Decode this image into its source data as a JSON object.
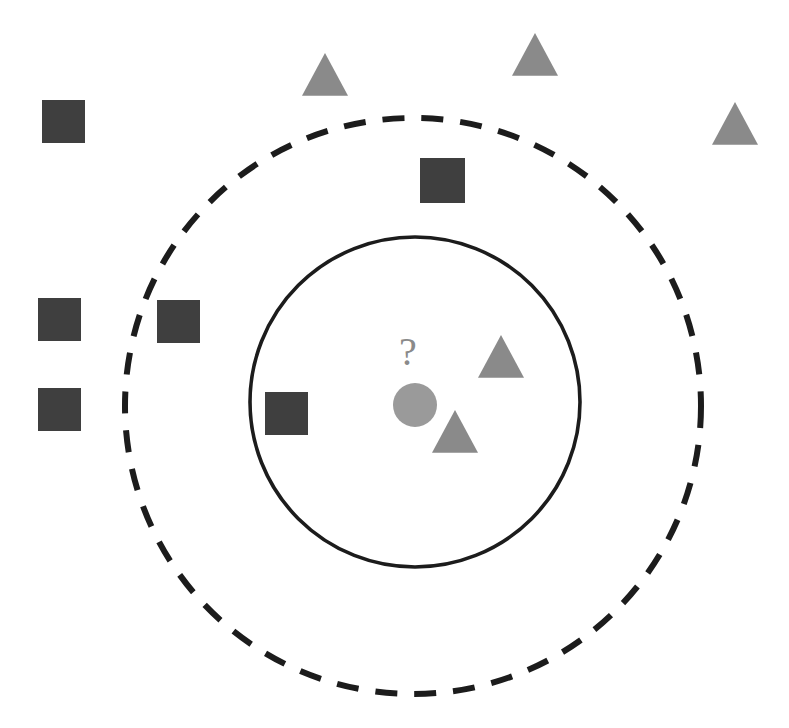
{
  "figure": {
    "title": "",
    "background_color": "#ffffff",
    "width": 789,
    "height": 728,
    "query_symbol": "?"
  },
  "palette": {
    "class_a_color": "#3f3f3f",
    "class_b_color": "#8a8a8a",
    "query_color": "#9a9a9a",
    "boundary_color": "#1c1c1c"
  },
  "boundaries": [
    {
      "name": "outer-boundary",
      "style": "dashed",
      "cx": 413,
      "cy": 406,
      "r": 288,
      "stroke": "#1c1c1c",
      "stroke_width": 6,
      "dasharray": "22 17"
    },
    {
      "name": "inner-boundary",
      "style": "solid",
      "cx": 415,
      "cy": 402,
      "r": 165,
      "stroke": "#1c1c1c",
      "stroke_width": 3.6,
      "dasharray": ""
    }
  ],
  "query_point": {
    "name": "query-point",
    "shape": "circle",
    "cx": 415,
    "cy": 405,
    "r": 22,
    "color": "#9a9a9a",
    "label": "?",
    "label_x": 408,
    "label_y": 365
  },
  "shapes": [
    {
      "id": "square-1",
      "shape": "square",
      "class": "class-a",
      "x": 38,
      "y": 298,
      "size": 43,
      "color": "#3f3f3f",
      "region": "outside"
    },
    {
      "id": "square-2",
      "shape": "square",
      "class": "class-a",
      "x": 38,
      "y": 388,
      "size": 43,
      "color": "#3f3f3f",
      "region": "outside"
    },
    {
      "id": "square-3",
      "shape": "square",
      "class": "class-a",
      "x": 157,
      "y": 300,
      "size": 43,
      "color": "#3f3f3f",
      "region": "outside"
    },
    {
      "id": "square-4",
      "shape": "square",
      "class": "class-a",
      "x": 42,
      "y": 100,
      "size": 43,
      "color": "#3f3f3f",
      "region": "outside"
    },
    {
      "id": "square-5",
      "shape": "square",
      "class": "class-a",
      "x": 420,
      "y": 158,
      "size": 45,
      "color": "#3f3f3f",
      "region": "between"
    },
    {
      "id": "square-6",
      "shape": "square",
      "class": "class-a",
      "x": 265,
      "y": 392,
      "size": 43,
      "color": "#3f3f3f",
      "region": "inner"
    },
    {
      "id": "triangle-1",
      "shape": "triangle",
      "class": "class-b",
      "x": 302,
      "y": 53,
      "size": 46,
      "color": "#8a8a8a",
      "region": "outside"
    },
    {
      "id": "triangle-2",
      "shape": "triangle",
      "class": "class-b",
      "x": 512,
      "y": 33,
      "size": 46,
      "color": "#8a8a8a",
      "region": "outside"
    },
    {
      "id": "triangle-3",
      "shape": "triangle",
      "class": "class-b",
      "x": 712,
      "y": 102,
      "size": 46,
      "color": "#8a8a8a",
      "region": "outside"
    },
    {
      "id": "triangle-4",
      "shape": "triangle",
      "class": "class-b",
      "x": 478,
      "y": 335,
      "size": 46,
      "color": "#8a8a8a",
      "region": "inner"
    },
    {
      "id": "triangle-5",
      "shape": "triangle",
      "class": "class-b",
      "x": 432,
      "y": 410,
      "size": 46,
      "color": "#8a8a8a",
      "region": "inner"
    }
  ],
  "counts": {
    "total_squares": 6,
    "total_triangles": 5,
    "inner_squares": 1,
    "inner_triangles": 2
  }
}
